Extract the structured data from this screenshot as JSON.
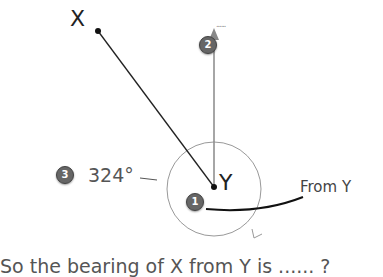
{
  "diagram": {
    "point_x_label": "X",
    "point_y_label": "Y",
    "north_label": "......",
    "angle_label": "324°",
    "from_label": "From Y",
    "caption": "So the bearing of X from Y is ...... ?",
    "badges": [
      "1",
      "2",
      "3"
    ],
    "colors": {
      "line": "#222222",
      "north_arrow": "#888888",
      "circle": "#999999",
      "badge": "#666666"
    }
  }
}
